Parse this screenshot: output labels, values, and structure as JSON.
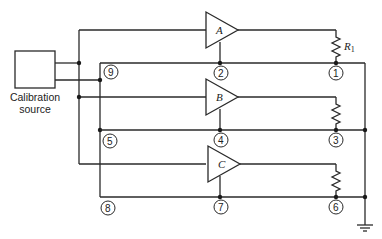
{
  "source": {
    "label_line1": "Calibration",
    "label_line2": "source"
  },
  "amplifiers": [
    {
      "id": "A",
      "label": "A"
    },
    {
      "id": "B",
      "label": "B"
    },
    {
      "id": "C",
      "label": "C"
    }
  ],
  "resistor_label": {
    "main": "R",
    "sub": "1"
  },
  "nodes": {
    "n1": "1",
    "n2": "2",
    "n3": "3",
    "n4": "4",
    "n5": "5",
    "n6": "6",
    "n7": "7",
    "n8": "8",
    "n9": "9"
  },
  "colors": {
    "line": "#2a2a2a",
    "background": "#ffffff"
  }
}
